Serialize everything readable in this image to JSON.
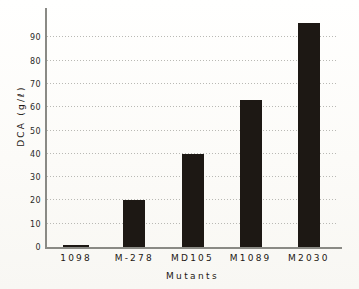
{
  "chart_data": {
    "type": "bar",
    "title": "",
    "xlabel": "Mutants",
    "ylabel": "DCA  (g/ℓ)",
    "categories": [
      "1098",
      "M-278",
      "MD105",
      "M1089",
      "M2030"
    ],
    "values": [
      1,
      20,
      40,
      63,
      96
    ],
    "ylim": [
      0,
      100
    ],
    "ytick_labels": [
      "0",
      "10",
      "20",
      "30",
      "40",
      "50",
      "60",
      "70",
      "80",
      "90"
    ],
    "ytick_values": [
      0,
      10,
      20,
      30,
      40,
      50,
      60,
      70,
      80,
      90
    ],
    "grid": "horizontal-dotted",
    "legend": "none",
    "bar_color": "#1d1814",
    "grid_color": "#b9b9b4",
    "axis_color": "#8a8a85",
    "background_color": "#fdfdfb"
  }
}
